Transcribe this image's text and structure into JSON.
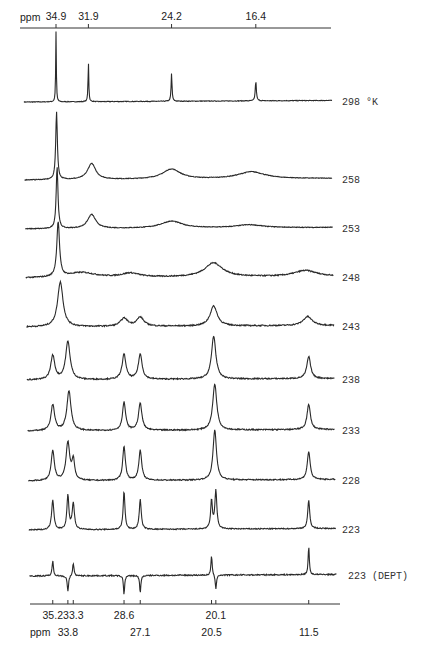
{
  "chart_data": {
    "type": "line",
    "title": "",
    "xlabel": "ppm",
    "ylabel": "",
    "x_direction": "decreasing",
    "grid": false,
    "top_axis": {
      "label": "ppm",
      "ticks": [
        {
          "ppm": 34.9,
          "label": "34.9"
        },
        {
          "ppm": 31.9,
          "label": "31.9"
        },
        {
          "ppm": 24.2,
          "label": "24.2"
        },
        {
          "ppm": 16.4,
          "label": "16.4"
        }
      ]
    },
    "bottom_axis": {
      "label": "ppm",
      "ticks_row1": [
        {
          "ppm": 35.2,
          "label": "35.2"
        },
        {
          "ppm": 33.3,
          "label": "33.3"
        },
        {
          "ppm": 28.6,
          "label": "28.6"
        },
        {
          "ppm": 20.1,
          "label": "20.1"
        }
      ],
      "ticks_row2": [
        {
          "ppm": 33.8,
          "label": "33.8"
        },
        {
          "ppm": 27.1,
          "label": "27.1"
        },
        {
          "ppm": 20.5,
          "label": "20.5"
        },
        {
          "ppm": 11.5,
          "label": "11.5"
        }
      ]
    },
    "series": [
      {
        "name": "298 °K",
        "label": "298  °K",
        "temperature": 298,
        "baseline_y": 102,
        "noise": 0.3,
        "peaks": [
          {
            "ppm": 34.9,
            "h": 70,
            "w": 0.07
          },
          {
            "ppm": 31.9,
            "h": 40,
            "w": 0.08
          },
          {
            "ppm": 24.2,
            "h": 28,
            "w": 0.1
          },
          {
            "ppm": 16.4,
            "h": 20,
            "w": 0.12
          }
        ]
      },
      {
        "name": "258",
        "label": "258",
        "temperature": 258,
        "baseline_y": 180,
        "noise": 0.3,
        "peaks": [
          {
            "ppm": 34.85,
            "h": 68,
            "w": 0.18
          },
          {
            "ppm": 31.6,
            "h": 16,
            "w": 0.9
          },
          {
            "ppm": 24.2,
            "h": 10,
            "w": 2.0
          },
          {
            "ppm": 16.8,
            "h": 7,
            "w": 3.0
          }
        ]
      },
      {
        "name": "253",
        "label": "253",
        "temperature": 253,
        "baseline_y": 229,
        "noise": 0.35,
        "peaks": [
          {
            "ppm": 34.8,
            "h": 62,
            "w": 0.2
          },
          {
            "ppm": 31.6,
            "h": 14,
            "w": 0.9
          },
          {
            "ppm": 24.2,
            "h": 7,
            "w": 2.4
          },
          {
            "ppm": 17.0,
            "h": 3,
            "w": 3.0
          }
        ]
      },
      {
        "name": "248",
        "label": "248",
        "temperature": 248,
        "baseline_y": 278,
        "noise": 0.55,
        "peaks": [
          {
            "ppm": 34.7,
            "h": 55,
            "w": 0.3
          },
          {
            "ppm": 32.5,
            "h": 5,
            "w": 3
          },
          {
            "ppm": 28.0,
            "h": 4,
            "w": 2.0
          },
          {
            "ppm": 20.3,
            "h": 14,
            "w": 2.0
          },
          {
            "ppm": 11.8,
            "h": 6,
            "w": 2.5
          }
        ]
      },
      {
        "name": "243",
        "label": "243",
        "temperature": 243,
        "baseline_y": 327,
        "noise": 0.6,
        "peaks": [
          {
            "ppm": 34.5,
            "h": 45,
            "w": 0.6
          },
          {
            "ppm": 28.6,
            "h": 8,
            "w": 0.8
          },
          {
            "ppm": 27.1,
            "h": 9,
            "w": 0.8
          },
          {
            "ppm": 20.3,
            "h": 20,
            "w": 0.8
          },
          {
            "ppm": 11.6,
            "h": 9,
            "w": 1.0
          }
        ]
      },
      {
        "name": "238",
        "label": "238",
        "temperature": 238,
        "baseline_y": 380,
        "noise": 0.6,
        "peaks": [
          {
            "ppm": 35.2,
            "h": 24,
            "w": 0.45
          },
          {
            "ppm": 33.8,
            "h": 38,
            "w": 0.5
          },
          {
            "ppm": 28.6,
            "h": 25,
            "w": 0.42
          },
          {
            "ppm": 27.1,
            "h": 25,
            "w": 0.42
          },
          {
            "ppm": 20.3,
            "h": 43,
            "w": 0.48
          },
          {
            "ppm": 11.5,
            "h": 22,
            "w": 0.42
          }
        ]
      },
      {
        "name": "233",
        "label": "233",
        "temperature": 233,
        "baseline_y": 431,
        "noise": 0.6,
        "peaks": [
          {
            "ppm": 35.2,
            "h": 26,
            "w": 0.4
          },
          {
            "ppm": 33.7,
            "h": 40,
            "w": 0.45
          },
          {
            "ppm": 28.6,
            "h": 28,
            "w": 0.35
          },
          {
            "ppm": 27.1,
            "h": 27,
            "w": 0.38
          },
          {
            "ppm": 20.2,
            "h": 46,
            "w": 0.45
          },
          {
            "ppm": 11.5,
            "h": 25,
            "w": 0.38
          }
        ]
      },
      {
        "name": "228",
        "label": "228",
        "temperature": 228,
        "baseline_y": 481,
        "noise": 0.55,
        "peaks": [
          {
            "ppm": 35.2,
            "h": 30,
            "w": 0.35
          },
          {
            "ppm": 33.8,
            "h": 38,
            "w": 0.4
          },
          {
            "ppm": 33.3,
            "h": 20,
            "w": 0.3
          },
          {
            "ppm": 28.6,
            "h": 34,
            "w": 0.3
          },
          {
            "ppm": 27.1,
            "h": 30,
            "w": 0.32
          },
          {
            "ppm": 20.2,
            "h": 50,
            "w": 0.38
          },
          {
            "ppm": 11.5,
            "h": 28,
            "w": 0.32
          }
        ]
      },
      {
        "name": "223",
        "label": "223",
        "temperature": 223,
        "baseline_y": 530,
        "noise": 0.5,
        "peaks": [
          {
            "ppm": 35.2,
            "h": 30,
            "w": 0.25
          },
          {
            "ppm": 33.8,
            "h": 34,
            "w": 0.22
          },
          {
            "ppm": 33.3,
            "h": 26,
            "w": 0.25
          },
          {
            "ppm": 28.6,
            "h": 38,
            "w": 0.2
          },
          {
            "ppm": 27.1,
            "h": 30,
            "w": 0.22
          },
          {
            "ppm": 20.5,
            "h": 28,
            "w": 0.2
          },
          {
            "ppm": 20.1,
            "h": 38,
            "w": 0.22
          },
          {
            "ppm": 11.5,
            "h": 28,
            "w": 0.22
          }
        ]
      },
      {
        "name": "223 (DEPT)",
        "label": "223  (DEPT)",
        "temperature": 223,
        "baseline_y": 576,
        "noise": 0.6,
        "peaks": [
          {
            "ppm": 35.2,
            "h": 15,
            "w": 0.15
          },
          {
            "ppm": 33.8,
            "h": -16,
            "w": 0.15
          },
          {
            "ppm": 33.3,
            "h": 13,
            "w": 0.15
          },
          {
            "ppm": 28.6,
            "h": -19,
            "w": 0.13
          },
          {
            "ppm": 27.1,
            "h": -18,
            "w": 0.13
          },
          {
            "ppm": 20.5,
            "h": 20,
            "w": 0.13
          },
          {
            "ppm": 20.1,
            "h": -15,
            "w": 0.13
          },
          {
            "ppm": 11.5,
            "h": 28,
            "w": 0.13
          }
        ]
      }
    ],
    "legend_position": "right (per-trace labels)"
  }
}
